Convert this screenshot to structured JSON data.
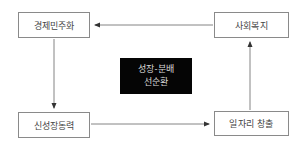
{
  "diagram": {
    "type": "cycle",
    "nodes": [
      {
        "id": "tl",
        "label": "경제민주화",
        "position": "top-left"
      },
      {
        "id": "tr",
        "label": "사회복지",
        "position": "top-right"
      },
      {
        "id": "bl",
        "label": "신성장동력",
        "position": "bottom-left"
      },
      {
        "id": "br",
        "label": "일자리 창출",
        "position": "bottom-right"
      }
    ],
    "center": {
      "line1": "성장-분배",
      "line2": "선순환"
    },
    "edges": [
      {
        "from": "tr",
        "to": "tl",
        "direction": "left"
      },
      {
        "from": "tl",
        "to": "bl",
        "direction": "down"
      },
      {
        "from": "bl",
        "to": "br",
        "direction": "right"
      },
      {
        "from": "br",
        "to": "tr",
        "direction": "up"
      }
    ],
    "colors": {
      "box_border": "#8a8a8a",
      "line": "#555555",
      "center_bg": "#050505",
      "center_text": "#d8d8d8"
    }
  }
}
